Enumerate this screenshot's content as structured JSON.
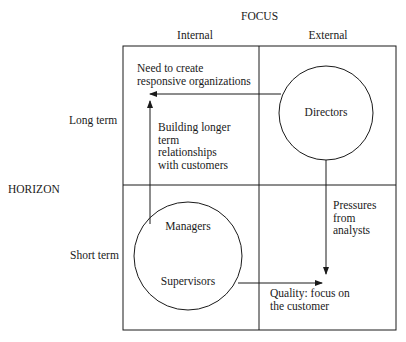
{
  "diagram": {
    "axis_top": "FOCUS",
    "axis_left": "HORIZON",
    "columns": [
      "Internal",
      "External"
    ],
    "rows": [
      "Long term",
      "Short term"
    ],
    "circles": {
      "directors": "Directors",
      "managers": "Managers",
      "supervisors": "Supervisors"
    },
    "annotations": {
      "need_responsive": "Need to create\nresponsive organizations",
      "building_relationships": "Building longer\nterm\nrelationships\nwith customers",
      "pressures_analysts": "Pressures\nfrom\nanalysts",
      "quality_focus": "Quality: focus on\nthe customer"
    },
    "colors": {
      "line": "#1a1a1a",
      "background": "#ffffff"
    }
  }
}
